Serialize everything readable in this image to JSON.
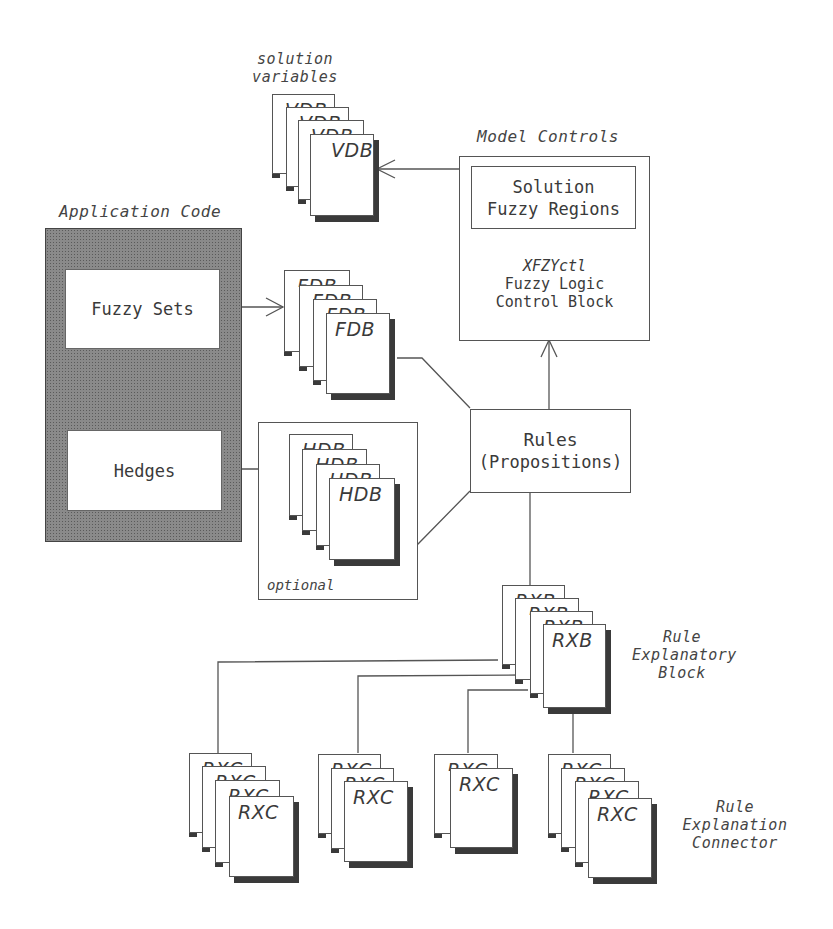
{
  "diagram": {
    "title_labels": {
      "solution_variables": [
        "solution",
        "variables"
      ],
      "model_controls": "Model Controls",
      "application_code": "Application Code",
      "optional": "optional",
      "rule_explanatory_block": [
        "Rule",
        "Explanatory",
        "Block"
      ],
      "rule_explanation_connector": [
        "Rule",
        "Explanation",
        "Connector"
      ]
    },
    "application_code": {
      "fuzzy_sets": "Fuzzy Sets",
      "hedges": "Hedges"
    },
    "model_controls": {
      "inner_box": [
        "Solution",
        "Fuzzy Regions"
      ],
      "block_name": "XFZYctl",
      "block_desc": [
        "Fuzzy Logic",
        "Control Block"
      ]
    },
    "rules": {
      "title": "Rules",
      "subtitle": "(Propositions)"
    },
    "stacks": {
      "vdb": {
        "label": "VDB",
        "count": 4
      },
      "fdb": {
        "label": "FDB",
        "count": 4
      },
      "hdb": {
        "label": "HDB",
        "count": 4
      },
      "rxb": {
        "label": "RXB",
        "count": 4
      },
      "rxc_groups": [
        {
          "label": "RXC",
          "count": 4
        },
        {
          "label": "RXC",
          "count": 3
        },
        {
          "label": "RXC",
          "count": 2
        },
        {
          "label": "RXC",
          "count": 4
        }
      ]
    },
    "colors": {
      "line": "#555555",
      "text": "#3a3a3a",
      "hatch": "#8a8a8a",
      "shadow": "#3a3a3a"
    }
  }
}
